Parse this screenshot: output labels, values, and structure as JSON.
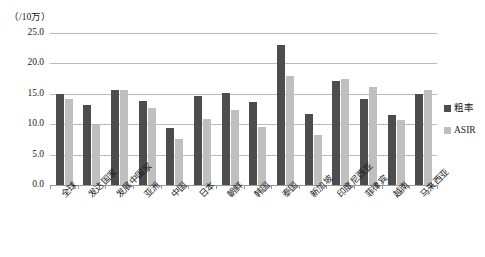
{
  "unit_label": "（/10万）",
  "legend": {
    "items": [
      {
        "label": "粗率",
        "color": "#4d4d4d",
        "key": "crude"
      },
      {
        "label": "ASIR",
        "color": "#bfbfbf",
        "key": "asir"
      }
    ]
  },
  "yaxis": {
    "ticks": [
      "0.0",
      "5.0",
      "10.0",
      "15.0",
      "20.0",
      "25.0"
    ]
  },
  "caption": "",
  "chart_data": {
    "type": "bar",
    "title": "",
    "subtitle": "",
    "xlabel": "",
    "ylabel": "（/10万）",
    "ylim": [
      0,
      25
    ],
    "ytick_step": 5,
    "grid": true,
    "legend_position": "right",
    "categories": [
      "全球",
      "发达国家",
      "发展中国家",
      "亚洲",
      "中国",
      "日本",
      "朝鲜",
      "韩国",
      "泰国",
      "新加坡",
      "印度尼西亚",
      "菲律宾",
      "越南",
      "马来西亚"
    ],
    "series": [
      {
        "name": "粗率",
        "color": "#4d4d4d",
        "values": [
          15.0,
          13.1,
          15.6,
          13.8,
          9.4,
          14.6,
          15.1,
          13.6,
          23.1,
          11.7,
          17.1,
          14.1,
          11.5,
          15.0
        ]
      },
      {
        "name": "ASIR",
        "color": "#bfbfbf",
        "values": [
          14.1,
          9.8,
          15.7,
          12.7,
          7.5,
          10.8,
          12.3,
          9.5,
          18.0,
          8.2,
          17.5,
          16.1,
          10.7,
          15.7
        ]
      }
    ]
  }
}
